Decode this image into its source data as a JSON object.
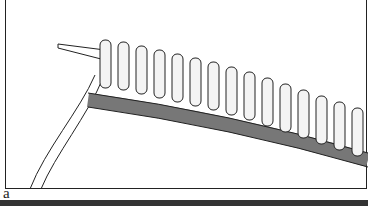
{
  "figure": {
    "panel_label": "a",
    "colors": {
      "line": "#222222",
      "fill_light": "#e8e8e8",
      "fill_dark": "#9a9a9a",
      "background": "#ffffff"
    }
  }
}
